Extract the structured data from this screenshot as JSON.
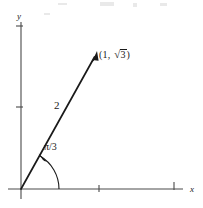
{
  "figure": {
    "kind": "math-diagram",
    "background_color": "#ffffff",
    "ink_color": "#1a1a1a",
    "axis_color": "#4a4a4a"
  },
  "axes": {
    "y_label": "y",
    "x_label": "x",
    "origin": {
      "x": 21,
      "y": 189
    },
    "y_axis": {
      "x": 21,
      "top": 22,
      "bottom": 199
    },
    "x_axis": {
      "y": 189,
      "left": 8,
      "right": 183
    },
    "x_ticks": [
      99,
      174
    ],
    "y_ticks": [
      26,
      107
    ],
    "tick_length": 7
  },
  "vector": {
    "magnitude_label": "2",
    "angle_label": "π/3",
    "angle_degrees": 60,
    "tip": {
      "x": 97,
      "y": 53
    },
    "point_label": {
      "open_paren": "(1,",
      "radical_sign": "√",
      "radicand": "3",
      "close_paren": ")",
      "full_text": "(1, √3)"
    }
  },
  "arc": {
    "radius": 38,
    "start_angle_degrees": 0,
    "end_angle_degrees": 60,
    "has_arrowhead": true
  }
}
